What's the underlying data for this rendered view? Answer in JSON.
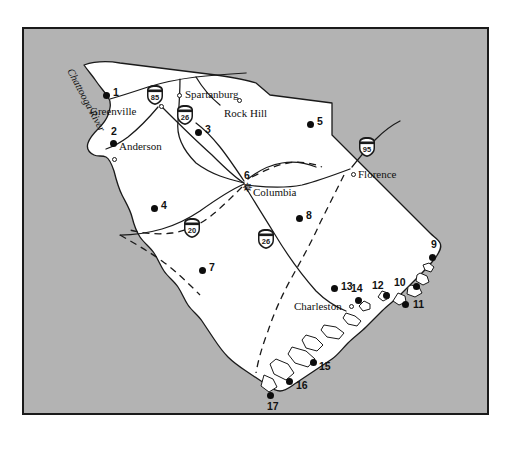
{
  "figure": {
    "background_color": "#b3b3b3",
    "land_color": "#ffffff",
    "border_color": "#1a1a1a"
  },
  "river_labels": [
    {
      "name": "chattooga-river",
      "text": "Chattooga River",
      "x": 50,
      "y": 38,
      "rotation": 62
    }
  ],
  "cities": [
    {
      "name": "greenville",
      "text": "Greenville",
      "label_x": 66,
      "label_y": 77,
      "marker_x": 135,
      "marker_y": 75,
      "marker": "open"
    },
    {
      "name": "spartanburg",
      "text": "Spartanburg",
      "label_x": 161,
      "label_y": 60,
      "marker_x": 153,
      "marker_y": 64,
      "marker": "open"
    },
    {
      "name": "rock-hill",
      "text": "Rock Hill",
      "label_x": 200,
      "label_y": 79,
      "marker_x": 213,
      "marker_y": 69,
      "marker": "open"
    },
    {
      "name": "anderson",
      "text": "Anderson",
      "label_x": 95,
      "label_y": 112,
      "marker_x": 88,
      "marker_y": 121,
      "marker": "open"
    },
    {
      "name": "columbia",
      "text": "Columbia",
      "label_x": 229,
      "label_y": 158,
      "marker_x": 221,
      "marker_y": 155,
      "marker": "star"
    },
    {
      "name": "florence",
      "text": "Florence",
      "label_x": 334,
      "label_y": 140,
      "marker_x": 327,
      "marker_y": 136,
      "marker": "open"
    },
    {
      "name": "charleston",
      "text": "Charleston",
      "label_x": 270,
      "label_y": 272,
      "marker_x": 325,
      "marker_y": 272,
      "marker": "open"
    }
  ],
  "anderson_extra_circle": {
    "name": "anderson-second-circle",
    "x": 88,
    "y": 128
  },
  "site_points": [
    {
      "id": "1",
      "dot_x": 79,
      "dot_y": 63,
      "label_x": 89,
      "label_y": 58
    },
    {
      "id": "2",
      "dot_x": 86,
      "dot_y": 111,
      "label_x": 87,
      "label_y": 97
    },
    {
      "id": "3",
      "dot_x": 171,
      "dot_y": 100,
      "label_x": 181,
      "label_y": 95
    },
    {
      "id": "4",
      "dot_x": 127,
      "dot_y": 176,
      "label_x": 137,
      "label_y": 171
    },
    {
      "id": "5",
      "dot_x": 283,
      "dot_y": 92,
      "label_x": 293,
      "label_y": 87
    },
    {
      "id": "6",
      "dot_x": 0,
      "dot_y": 0,
      "label_x": 220,
      "label_y": 141
    },
    {
      "id": "7",
      "dot_x": 175,
      "dot_y": 238,
      "label_x": 185,
      "label_y": 233
    },
    {
      "id": "8",
      "dot_x": 272,
      "dot_y": 186,
      "label_x": 282,
      "label_y": 181
    },
    {
      "id": "9",
      "dot_x": 411,
      "dot_y": 227,
      "label_x": 409,
      "label_y": 211
    },
    {
      "id": "10",
      "dot_x": 392,
      "dot_y": 257,
      "label_x": 372,
      "label_y": 250
    },
    {
      "id": "11",
      "dot_x": 381,
      "dot_y": 275,
      "label_x": 391,
      "label_y": 272
    },
    {
      "id": "12",
      "dot_x": 363,
      "dot_y": 266,
      "label_x": 350,
      "label_y": 255
    },
    {
      "id": "13",
      "dot_x": 310,
      "dot_y": 258,
      "label_x": 319,
      "label_y": 254
    },
    {
      "id": "14",
      "dot_x": 334,
      "dot_y": 271,
      "label_x": 329,
      "label_y": 257
    },
    {
      "id": "15",
      "dot_x": 289,
      "dot_y": 333,
      "label_x": 296,
      "label_y": 333
    },
    {
      "id": "16",
      "dot_x": 265,
      "dot_y": 352,
      "label_x": 273,
      "label_y": 352
    },
    {
      "id": "17",
      "dot_x": 246,
      "dot_y": 366,
      "label_x": 246,
      "label_y": 372
    }
  ],
  "interstate_shields": [
    {
      "id": "85",
      "x": 122,
      "y": 60
    },
    {
      "id": "26",
      "x": 152,
      "y": 80
    },
    {
      "id": "95",
      "x": 334,
      "y": 112
    },
    {
      "id": "20",
      "x": 159,
      "y": 193
    },
    {
      "id": "26",
      "x": 233,
      "y": 204
    }
  ]
}
